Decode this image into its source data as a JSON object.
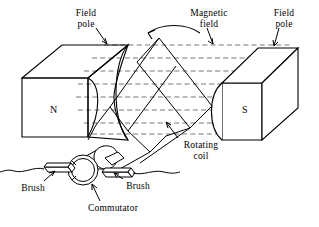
{
  "figure": {
    "background_color": "#ffffff",
    "line_color": "#000000",
    "field_line_color": "#555555"
  },
  "labels": {
    "field_pole_left": "Field\npole",
    "magnetic_field": "Magnetic\nfield",
    "field_pole_right": "Field\npole",
    "rotating_coil": "Rotating\ncoil",
    "brush_left": "Brush",
    "brush_right": "Brush",
    "commutator": "Commutator",
    "north_pole": "N",
    "south_pole": "S"
  },
  "diagram_data": {
    "type": "technical-illustration",
    "subject": "DC generator / motor principle",
    "components": [
      {
        "name": "field-pole-left",
        "label": "Field pole",
        "polarity": "N",
        "shape": "rectangular block with concave inner face"
      },
      {
        "name": "field-pole-right",
        "label": "Field pole",
        "polarity": "S",
        "shape": "rectangular block with concave inner face"
      },
      {
        "name": "magnetic-field",
        "label": "Magnetic field",
        "rendering": "horizontal dashed lines from N to S",
        "line_count": 7
      },
      {
        "name": "rotating-coil",
        "label": "Rotating coil",
        "rendering": "tilted single-turn loop between poles"
      },
      {
        "name": "rotation-arrow",
        "label": "",
        "direction": "counterclockwise"
      },
      {
        "name": "commutator",
        "label": "Commutator",
        "rendering": "split ring on shaft"
      },
      {
        "name": "brush-left",
        "label": "Brush",
        "rendering": "bar contacting commutator, wire to left"
      },
      {
        "name": "brush-right",
        "label": "Brush",
        "rendering": "bar contacting commutator, wire to right"
      }
    ]
  }
}
